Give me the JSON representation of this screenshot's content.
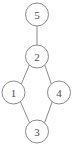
{
  "figure": {
    "kind": "undirected-graph-diagram",
    "width": 73,
    "height": 148,
    "background_color": "#ffffff",
    "stroke_color": "#8a8a8a",
    "label_color": "#4a4a4a",
    "node_radius": 11.5
  },
  "graph": {
    "nodes": [
      {
        "id": "5",
        "label": "5",
        "cx": 37,
        "cy": 14.5
      },
      {
        "id": "2",
        "label": "2",
        "cx": 37,
        "cy": 56.5
      },
      {
        "id": "1",
        "label": "1",
        "cx": 13.5,
        "cy": 92.5
      },
      {
        "id": "4",
        "label": "4",
        "cx": 59,
        "cy": 92.5
      },
      {
        "id": "3",
        "label": "3",
        "cx": 37,
        "cy": 131.5
      }
    ],
    "edges": [
      {
        "from": "5",
        "to": "2",
        "x1": 37,
        "y1": 26,
        "x2": 37,
        "y2": 45
      },
      {
        "from": "2",
        "to": "1",
        "x1": 29.3,
        "y1": 65,
        "x2": 21.3,
        "y2": 84
      },
      {
        "from": "2",
        "to": "4",
        "x1": 44.8,
        "y1": 65,
        "x2": 51.3,
        "y2": 84
      },
      {
        "from": "1",
        "to": "3",
        "x1": 20.3,
        "y1": 101.5,
        "x2": 29.7,
        "y2": 123
      },
      {
        "from": "4",
        "to": "3",
        "x1": 52.3,
        "y1": 101.5,
        "x2": 44.5,
        "y2": 123
      }
    ]
  }
}
